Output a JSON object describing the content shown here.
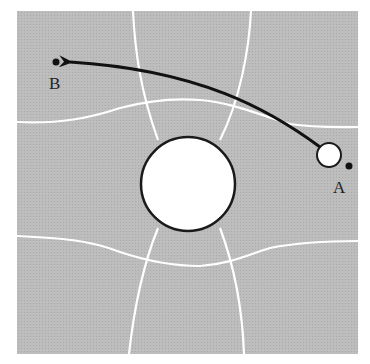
{
  "diagram": {
    "type": "equipotential-field",
    "colors": {
      "background": "#ffffff",
      "field": "#b9b9b9",
      "grid_lines": "#ffffff",
      "outline": "#1a1a1a",
      "arrow": "#111111"
    },
    "conductor": {
      "shape": "circle",
      "cx": 188,
      "cy": 184,
      "r": 47,
      "fill": "#ffffff"
    },
    "test_charge": {
      "shape": "circle",
      "cx": 329,
      "cy": 155,
      "r": 12,
      "fill": "#ffffff"
    },
    "points": [
      {
        "id": "A",
        "label": "A",
        "x": 349,
        "y": 166,
        "label_x": 333,
        "label_y": 192
      },
      {
        "id": "B",
        "label": "B",
        "x": 56,
        "y": 62,
        "label_x": 49,
        "label_y": 88
      }
    ],
    "path": {
      "from": "A",
      "to": "B",
      "description": "curved arrow from test charge near A to point B"
    }
  }
}
